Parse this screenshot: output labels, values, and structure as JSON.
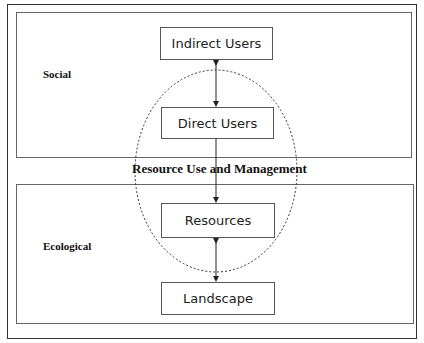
{
  "diagram": {
    "domains": {
      "social": {
        "label": "Social"
      },
      "ecological": {
        "label": "Ecological"
      }
    },
    "center_label": "Resource Use and Management",
    "nodes": [
      {
        "id": "indirect-users",
        "label": "Indirect Users"
      },
      {
        "id": "direct-users",
        "label": "Direct Users"
      },
      {
        "id": "resources",
        "label": "Resources"
      },
      {
        "id": "landscape",
        "label": "Landscape"
      }
    ],
    "edges": [
      {
        "from": "indirect-users",
        "to": "direct-users",
        "type": "bidirectional"
      },
      {
        "from": "direct-users",
        "to": "resources",
        "type": "directed"
      },
      {
        "from": "resources",
        "to": "landscape",
        "type": "bidirectional"
      }
    ],
    "colors": {
      "frame": "#333333",
      "box_border": "#555555",
      "ellipse": "#333333",
      "text": "#222222"
    }
  }
}
